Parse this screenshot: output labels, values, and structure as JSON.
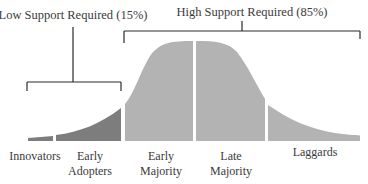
{
  "diagram": {
    "groups": {
      "low": {
        "label": "Low Support Required (15%)",
        "percent": 15
      },
      "high": {
        "label": "High Support Required (85%)",
        "percent": 85
      }
    },
    "segments": [
      {
        "name": "Innovators",
        "label_lines": [
          "Innovators"
        ],
        "color": "#7d7d7d"
      },
      {
        "name": "Early Adopters",
        "label_lines": [
          "Early",
          "Adopters"
        ],
        "color": "#7d7d7d"
      },
      {
        "name": "Early Majority",
        "label_lines": [
          "Early",
          "Majority"
        ],
        "color": "#b3b3b3"
      },
      {
        "name": "Late Majority",
        "label_lines": [
          "Late",
          "Majority"
        ],
        "color": "#b3b3b3"
      },
      {
        "name": "Laggards",
        "label_lines": [
          "Laggards"
        ],
        "color": "#b3b3b3"
      }
    ],
    "colors": {
      "low_support_fill": "#7d7d7d",
      "high_support_fill": "#b3b3b3",
      "bracket_line": "#2b2b2b"
    }
  }
}
